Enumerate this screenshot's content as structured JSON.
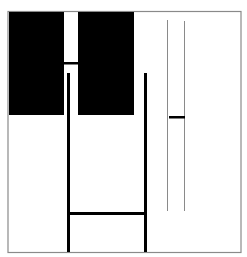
{
  "figure": {
    "colors": {
      "background": "#ffffff",
      "frame": "#8a8a8a",
      "ink": "#000000",
      "thin_line": "#8a8a8a"
    },
    "elements": [
      {
        "id": "frame",
        "kind": "frame"
      },
      {
        "id": "block-left",
        "kind": "filled-rectangle"
      },
      {
        "id": "block-right",
        "kind": "filled-rectangle"
      },
      {
        "id": "connector-bar",
        "kind": "short-horizontal-bar"
      },
      {
        "id": "post-left",
        "kind": "thick-vertical-line"
      },
      {
        "id": "post-right",
        "kind": "thick-vertical-line"
      },
      {
        "id": "crossbar",
        "kind": "thick-horizontal-line"
      },
      {
        "id": "thin-line-left",
        "kind": "thin-vertical-line"
      },
      {
        "id": "thin-line-right",
        "kind": "thin-vertical-line"
      },
      {
        "id": "thin-pair-bar",
        "kind": "short-horizontal-bar"
      }
    ]
  }
}
